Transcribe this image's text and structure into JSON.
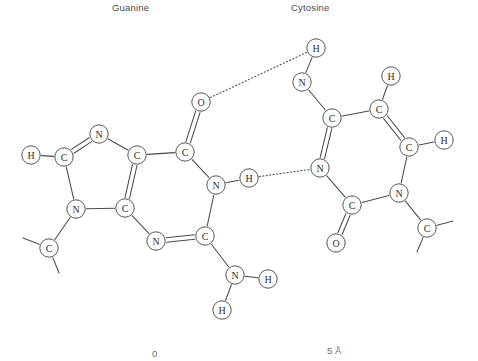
{
  "figure": {
    "type": "chemical-structure-diagram",
    "labels": {
      "left_base": "Guanine",
      "right_base": "Cytosine"
    },
    "scale": {
      "start_label": "0",
      "end_label": "5 Å"
    },
    "colors": {
      "bond": "#4b4b4b",
      "hbond": "#5a5a5a",
      "atom_stroke": "#555555",
      "atom_fill": "#ffffff",
      "atom_text": "#2f2f2f",
      "label_text": "#4a4a4a",
      "background": "#ffffff"
    }
  },
  "atoms": [
    {
      "id": "g_h_c8",
      "element": "H",
      "x": 31,
      "y": 155,
      "base": "guanine"
    },
    {
      "id": "g_c8",
      "element": "C",
      "x": 64,
      "y": 157,
      "base": "guanine"
    },
    {
      "id": "g_n7",
      "element": "N",
      "x": 99,
      "y": 134,
      "base": "guanine"
    },
    {
      "id": "g_c5",
      "element": "C",
      "x": 137,
      "y": 155,
      "base": "guanine"
    },
    {
      "id": "g_c4",
      "element": "C",
      "x": 125,
      "y": 208,
      "base": "guanine"
    },
    {
      "id": "g_n9",
      "element": "N",
      "x": 76,
      "y": 209,
      "base": "guanine"
    },
    {
      "id": "g_c1p",
      "element": "C",
      "x": 49,
      "y": 248,
      "base": "guanine"
    },
    {
      "id": "g_c6",
      "element": "C",
      "x": 185,
      "y": 152,
      "base": "guanine"
    },
    {
      "id": "g_o6",
      "element": "O",
      "x": 201,
      "y": 102,
      "base": "guanine"
    },
    {
      "id": "g_n1",
      "element": "N",
      "x": 216,
      "y": 185,
      "base": "guanine"
    },
    {
      "id": "g_h_n1",
      "element": "H",
      "x": 249,
      "y": 178,
      "base": "guanine"
    },
    {
      "id": "g_c2",
      "element": "C",
      "x": 205,
      "y": 236,
      "base": "guanine"
    },
    {
      "id": "g_n3",
      "element": "N",
      "x": 156,
      "y": 241,
      "base": "guanine"
    },
    {
      "id": "g_n2",
      "element": "N",
      "x": 235,
      "y": 275,
      "base": "guanine"
    },
    {
      "id": "g_h_n2a",
      "element": "H",
      "x": 268,
      "y": 279,
      "base": "guanine"
    },
    {
      "id": "g_h_n2b",
      "element": "H",
      "x": 222,
      "y": 310,
      "base": "guanine"
    },
    {
      "id": "c_n4",
      "element": "N",
      "x": 302,
      "y": 82,
      "base": "cytosine"
    },
    {
      "id": "c_h_n4",
      "element": "H",
      "x": 316,
      "y": 48,
      "base": "cytosine"
    },
    {
      "id": "c_c4",
      "element": "C",
      "x": 332,
      "y": 118,
      "base": "cytosine"
    },
    {
      "id": "c_c5",
      "element": "C",
      "x": 379,
      "y": 109,
      "base": "cytosine"
    },
    {
      "id": "c_h_c5",
      "element": "H",
      "x": 391,
      "y": 76,
      "base": "cytosine"
    },
    {
      "id": "c_c6",
      "element": "C",
      "x": 409,
      "y": 147,
      "base": "cytosine"
    },
    {
      "id": "c_h_c6",
      "element": "H",
      "x": 444,
      "y": 140,
      "base": "cytosine"
    },
    {
      "id": "c_n3",
      "element": "N",
      "x": 320,
      "y": 168,
      "base": "cytosine"
    },
    {
      "id": "c_n1",
      "element": "N",
      "x": 399,
      "y": 193,
      "base": "cytosine"
    },
    {
      "id": "c_c2",
      "element": "C",
      "x": 352,
      "y": 205,
      "base": "cytosine"
    },
    {
      "id": "c_o2",
      "element": "O",
      "x": 336,
      "y": 243,
      "base": "cytosine"
    },
    {
      "id": "c_c1p",
      "element": "C",
      "x": 427,
      "y": 228,
      "base": "cytosine"
    }
  ],
  "bonds": [
    {
      "from": "g_h_c8",
      "to": "g_c8",
      "order": 1
    },
    {
      "from": "g_c8",
      "to": "g_n7",
      "order": 2
    },
    {
      "from": "g_n7",
      "to": "g_c5",
      "order": 1
    },
    {
      "from": "g_c5",
      "to": "g_c4",
      "order": 2
    },
    {
      "from": "g_c4",
      "to": "g_n9",
      "order": 1
    },
    {
      "from": "g_n9",
      "to": "g_c8",
      "order": 1
    },
    {
      "from": "g_n9",
      "to": "g_c1p",
      "order": 1
    },
    {
      "from": "g_c5",
      "to": "g_c6",
      "order": 1
    },
    {
      "from": "g_c6",
      "to": "g_o6",
      "order": 2
    },
    {
      "from": "g_c6",
      "to": "g_n1",
      "order": 1
    },
    {
      "from": "g_n1",
      "to": "g_h_n1",
      "order": 1
    },
    {
      "from": "g_n1",
      "to": "g_c2",
      "order": 1
    },
    {
      "from": "g_c2",
      "to": "g_n3",
      "order": 2
    },
    {
      "from": "g_n3",
      "to": "g_c4",
      "order": 1
    },
    {
      "from": "g_c2",
      "to": "g_n2",
      "order": 1
    },
    {
      "from": "g_n2",
      "to": "g_h_n2a",
      "order": 1
    },
    {
      "from": "g_n2",
      "to": "g_h_n2b",
      "order": 1
    },
    {
      "from": "c_n4",
      "to": "c_h_n4",
      "order": 1
    },
    {
      "from": "c_n4",
      "to": "c_c4",
      "order": 1
    },
    {
      "from": "c_c4",
      "to": "c_c5",
      "order": 1
    },
    {
      "from": "c_c5",
      "to": "c_h_c5",
      "order": 1
    },
    {
      "from": "c_c5",
      "to": "c_c6",
      "order": 2
    },
    {
      "from": "c_c6",
      "to": "c_h_c6",
      "order": 1
    },
    {
      "from": "c_c6",
      "to": "c_n1",
      "order": 1
    },
    {
      "from": "c_n1",
      "to": "c_c2",
      "order": 1
    },
    {
      "from": "c_n1",
      "to": "c_c1p",
      "order": 1
    },
    {
      "from": "c_c2",
      "to": "c_o2",
      "order": 2
    },
    {
      "from": "c_c2",
      "to": "c_n3",
      "order": 1
    },
    {
      "from": "c_n3",
      "to": "c_c4",
      "order": 2
    }
  ],
  "hydrogen_bonds": [
    {
      "from": "g_o6",
      "to": "c_h_n4"
    },
    {
      "from": "g_h_n1",
      "to": "c_n3"
    }
  ],
  "sugar_stubs": [
    {
      "from": "g_c1p",
      "dx": -26,
      "dy": -10
    },
    {
      "from": "g_c1p",
      "dx": 10,
      "dy": 25
    },
    {
      "from": "c_c1p",
      "dx": 26,
      "dy": -7
    },
    {
      "from": "c_c1p",
      "dx": -10,
      "dy": 24
    }
  ]
}
